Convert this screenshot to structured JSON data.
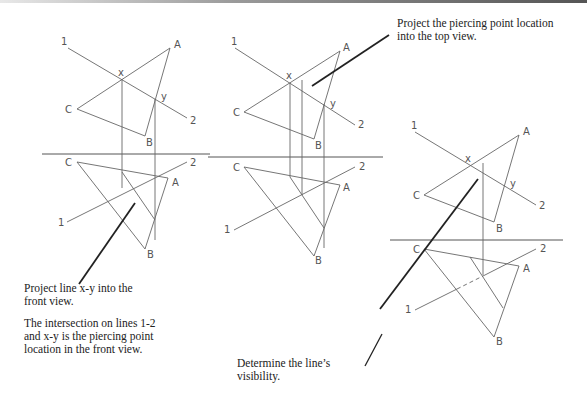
{
  "figure": {
    "views": [
      {
        "id": "view-1",
        "top_labels": {
          "one": "1",
          "two": "2",
          "a": "A",
          "b": "B",
          "c": "C",
          "x": "x",
          "y": "y"
        },
        "front_labels": {
          "one": "1",
          "two": "2",
          "a": "A",
          "b": "B",
          "c": "C"
        }
      },
      {
        "id": "view-2",
        "top_labels": {
          "one": "1",
          "two": "2",
          "a": "A",
          "b": "B",
          "c": "C",
          "x": "x",
          "y": "y"
        },
        "front_labels": {
          "one": "1",
          "two": "2",
          "a": "A",
          "b": "B",
          "c": "C"
        }
      },
      {
        "id": "view-3",
        "top_labels": {
          "one": "1",
          "two": "2",
          "a": "A",
          "b": "B",
          "c": "C",
          "x": "x",
          "y": "y"
        },
        "front_labels": {
          "one": "1",
          "two": "2",
          "a": "A",
          "b": "B",
          "c": "C"
        }
      }
    ],
    "notes": {
      "step1": {
        "line1": "Project line x-y into the",
        "line2": "front view.",
        "line3": "The intersection on lines 1-2",
        "line4": "and x-y is the piercing point",
        "line5": "location in the front view."
      },
      "step2": {
        "line1": "Project the piercing point location",
        "line2": "into the top view."
      },
      "step3": {
        "line1": "Determine the line’s",
        "line2": "visibility."
      }
    },
    "colors": {
      "line": "#666666",
      "leader": "#222222",
      "text": "#222222"
    }
  }
}
